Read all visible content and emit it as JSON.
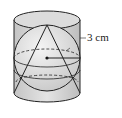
{
  "diagram": {
    "radius_label": "3 cm",
    "colors": {
      "stroke": "#222222",
      "cylinder_fill": "#d6d6d6",
      "sphere_fill": "#e6e6e6",
      "background": "#ffffff"
    }
  }
}
